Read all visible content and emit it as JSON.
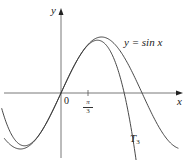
{
  "chart_data": {
    "type": "line",
    "title": "",
    "xlabel": "x",
    "ylabel": "y",
    "origin_label": "0",
    "x_ticks": [
      {
        "value": 1.0472,
        "label_num": "π",
        "label_den": "3"
      }
    ],
    "xlim": [
      -2.2,
      4.7
    ],
    "ylim": [
      -1.0,
      1.0
    ],
    "grid": false,
    "legend": "inline annotations",
    "series": [
      {
        "name": "y = sin x",
        "label": "y = sin x",
        "function": "sin(x)",
        "x_range": [
          -2.2,
          4.55
        ],
        "color": "#333333"
      },
      {
        "name": "T3",
        "label": "T",
        "label_sub": "3",
        "function": "x - x^3/6",
        "x_range": [
          -2.3,
          2.95
        ],
        "color": "#333333"
      }
    ],
    "annotations": [
      {
        "text": "y = sin x",
        "x": 2.3,
        "y": 0.85
      },
      {
        "text": "T3",
        "x": 2.5,
        "y": -0.75
      }
    ]
  },
  "labels": {
    "y_axis": "y",
    "x_axis": "x",
    "origin": "0",
    "tick_num": "π",
    "tick_den": "3",
    "sin_label": "y = sin x",
    "t3_label": "T",
    "t3_sub": "3"
  },
  "geometry": {
    "origin_px": [
      61,
      93
    ],
    "px_per_unit_x": 25.8,
    "px_per_unit_y": 56
  }
}
